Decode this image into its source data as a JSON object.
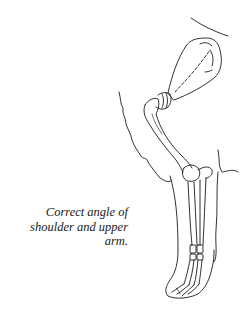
{
  "figure": {
    "caption": {
      "lines": [
        "Correct angle of",
        "shoulder and upper",
        "arm."
      ]
    },
    "colors": {
      "background": "#ffffff",
      "line": "#1a1a1a"
    }
  }
}
